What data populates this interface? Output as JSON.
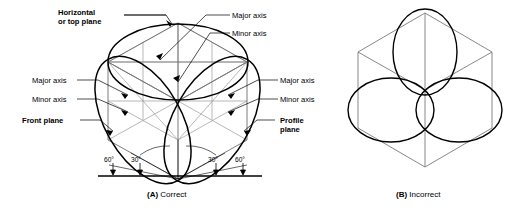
{
  "figure": {
    "background_color": "#ffffff",
    "line_color": "#000000",
    "construction_line_color": "#9a9a9a"
  },
  "panels": [
    {
      "id": "A",
      "caption_label": "(A)",
      "caption_text": "Correct",
      "description": "Isometric cube with three ellipses correctly oriented on top, front and profile planes"
    },
    {
      "id": "B",
      "caption_label": "(B)",
      "caption_text": "Incorrect",
      "description": "Isometric cube with three ellipses drawn axis aligned, incorrectly oriented"
    }
  ],
  "labels": {
    "top_plane": {
      "line1": "Horizontal",
      "line2": "or top plane",
      "bold": true
    },
    "front_plane": {
      "text": "Front plane",
      "bold": true
    },
    "profile_plane": {
      "line1": "Profile",
      "line2": "plane",
      "bold": true
    },
    "top_major": "Major axis",
    "top_minor": "Minor axis",
    "left_major": "Major axis",
    "left_minor": "Minor axis",
    "right_major": "Major axis",
    "right_minor": "Minor axis"
  },
  "angles": [
    {
      "value": "60°",
      "position": "outer-left"
    },
    {
      "value": "30°",
      "position": "inner-left"
    },
    {
      "value": "30°",
      "position": "inner-right"
    },
    {
      "value": "60°",
      "position": "outer-right"
    }
  ]
}
